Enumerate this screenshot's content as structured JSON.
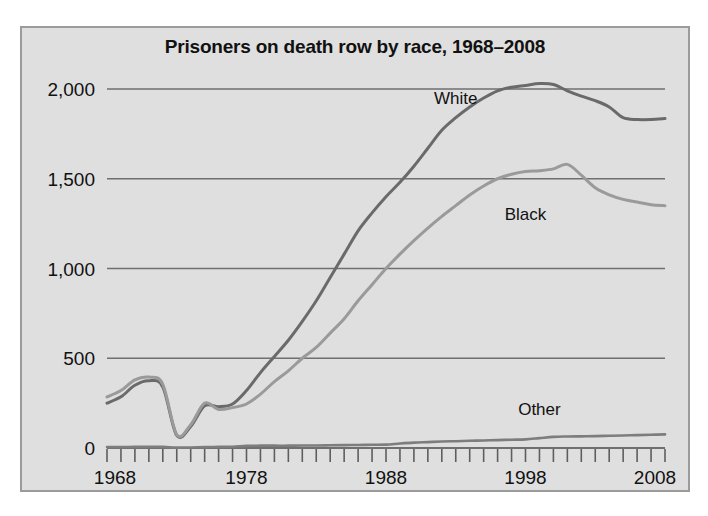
{
  "figure": {
    "title": "Prisoners on death row by race, 1968–2008",
    "background_color": "#dfdfdf",
    "frame_color": "#9b9b9b",
    "page_background": "#ffffff"
  },
  "axes": {
    "y_tick_labels": [
      "2,000",
      "1,500",
      "1,000",
      "500",
      "0"
    ],
    "y_tick_values": [
      2000,
      1500,
      1000,
      500,
      0
    ],
    "x_tick_labels": [
      "1968",
      "1978",
      "1988",
      "1998",
      "2008"
    ],
    "x_tick_values": [
      1968,
      1978,
      1988,
      1998,
      2008
    ]
  },
  "labels": {
    "white": "White",
    "black": "Black",
    "other": "Other"
  },
  "chart_data": {
    "type": "line",
    "title": "Prisoners on death row by race, 1968–2008",
    "xlabel": "",
    "ylabel": "",
    "xlim": [
      1968,
      2008
    ],
    "ylim": [
      0,
      2100
    ],
    "grid": true,
    "gridlines_y": [
      500,
      1000,
      1500,
      2000
    ],
    "legend_position": "inline-annotations",
    "x": [
      1968,
      1969,
      1970,
      1971,
      1972,
      1973,
      1974,
      1975,
      1976,
      1977,
      1978,
      1979,
      1980,
      1981,
      1982,
      1983,
      1984,
      1985,
      1986,
      1987,
      1988,
      1989,
      1990,
      1991,
      1992,
      1993,
      1994,
      1995,
      1996,
      1997,
      1998,
      1999,
      2000,
      2001,
      2002,
      2003,
      2004,
      2005,
      2006,
      2007,
      2008
    ],
    "series": [
      {
        "name": "White",
        "color": "#6a6a6a",
        "line_width": 3.0,
        "label_x": 1993,
        "label_y": 1915,
        "values": [
          250,
          285,
          350,
          375,
          340,
          70,
          120,
          235,
          230,
          245,
          320,
          420,
          510,
          600,
          705,
          820,
          950,
          1080,
          1210,
          1310,
          1400,
          1480,
          1570,
          1670,
          1770,
          1840,
          1900,
          1950,
          1990,
          2010,
          2020,
          2030,
          2025,
          1990,
          1960,
          1935,
          1900,
          1840,
          1830,
          1830,
          1835
        ]
      },
      {
        "name": "Black",
        "color": "#9a9a9a",
        "line_width": 3.0,
        "label_x": 1998,
        "label_y": 1270,
        "values": [
          285,
          320,
          380,
          395,
          355,
          75,
          130,
          250,
          215,
          225,
          245,
          300,
          370,
          430,
          500,
          560,
          640,
          720,
          820,
          910,
          1000,
          1080,
          1155,
          1225,
          1290,
          1350,
          1410,
          1460,
          1500,
          1525,
          1540,
          1545,
          1555,
          1580,
          1520,
          1450,
          1410,
          1385,
          1370,
          1355,
          1350
        ]
      },
      {
        "name": "Other",
        "color": "#7d7d7d",
        "line_width": 2.6,
        "label_x": 1999,
        "label_y": 185,
        "values": [
          5,
          5,
          6,
          6,
          6,
          2,
          3,
          5,
          6,
          7,
          12,
          13,
          13,
          13,
          14,
          14,
          15,
          16,
          17,
          18,
          19,
          25,
          30,
          33,
          36,
          38,
          40,
          42,
          44,
          46,
          48,
          55,
          62,
          64,
          65,
          66,
          68,
          70,
          72,
          74,
          76
        ]
      }
    ]
  }
}
